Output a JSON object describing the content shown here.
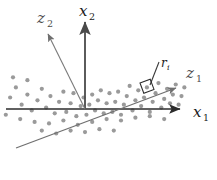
{
  "figure": {
    "title": "",
    "background_color": "#ffffff"
  },
  "chart_data": {
    "type": "scatter",
    "title": "",
    "xlabel": "",
    "ylabel": "",
    "grid": false,
    "legend": null,
    "xlim": [
      -1.0,
      1.0
    ],
    "ylim": [
      -1.0,
      1.0
    ],
    "point_color": "#9a9a9a",
    "point_radius": 2.1,
    "series": [
      {
        "name": "data-points",
        "points": [
          [
            -134,
            36
          ],
          [
            -118,
            24
          ],
          [
            -104,
            16
          ],
          [
            -96,
            30
          ],
          [
            -88,
            6
          ],
          [
            -80,
            20
          ],
          [
            -74,
            -2
          ],
          [
            -66,
            12
          ],
          [
            -60,
            28
          ],
          [
            -54,
            2
          ],
          [
            -48,
            18
          ],
          [
            -42,
            -6
          ],
          [
            -36,
            10
          ],
          [
            -30,
            24
          ],
          [
            -26,
            -4
          ],
          [
            -20,
            8
          ],
          [
            -16,
            22
          ],
          [
            -12,
            -10
          ],
          [
            -6,
            4
          ],
          [
            -2,
            16
          ],
          [
            2,
            -8
          ],
          [
            6,
            6
          ],
          [
            10,
            20
          ],
          [
            14,
            -2
          ],
          [
            18,
            12
          ],
          [
            22,
            26
          ],
          [
            26,
            -6
          ],
          [
            30,
            8
          ],
          [
            34,
            22
          ],
          [
            38,
            -4
          ],
          [
            42,
            10
          ],
          [
            46,
            24
          ],
          [
            50,
            -8
          ],
          [
            54,
            6
          ],
          [
            58,
            18
          ],
          [
            62,
            32
          ],
          [
            66,
            -2
          ],
          [
            70,
            12
          ],
          [
            74,
            26
          ],
          [
            78,
            4
          ],
          [
            82,
            16
          ],
          [
            86,
            30
          ],
          [
            90,
            -4
          ],
          [
            94,
            10
          ],
          [
            98,
            22
          ],
          [
            102,
            36
          ],
          [
            106,
            2
          ],
          [
            110,
            14
          ],
          [
            114,
            28
          ],
          [
            118,
            8
          ],
          [
            122,
            20
          ],
          [
            126,
            34
          ],
          [
            130,
            6
          ],
          [
            134,
            18
          ],
          [
            138,
            30
          ],
          [
            -110,
            -8
          ],
          [
            -90,
            -14
          ],
          [
            -70,
            -18
          ],
          [
            -50,
            -20
          ],
          [
            -30,
            -16
          ],
          [
            -10,
            -22
          ],
          [
            10,
            -18
          ],
          [
            30,
            -14
          ],
          [
            50,
            -16
          ],
          [
            70,
            -12
          ],
          [
            90,
            -10
          ],
          [
            110,
            -14
          ],
          [
            -60,
            -30
          ],
          [
            -40,
            -34
          ],
          [
            -20,
            -30
          ],
          [
            0,
            -32
          ],
          [
            20,
            -28
          ],
          [
            40,
            -30
          ],
          [
            -100,
            44
          ],
          [
            -80,
            40
          ]
        ]
      }
    ],
    "axes": [
      {
        "id": "x1",
        "label": "x",
        "subscript": "1",
        "style": "original",
        "color": "#2b2b2b",
        "stroke_width": 1.6,
        "arrow": true,
        "direction": "right",
        "angle_deg": 0
      },
      {
        "id": "x2",
        "label": "x",
        "subscript": "2",
        "style": "original",
        "color": "#4a4a4a",
        "stroke_width": 1.8,
        "arrow": true,
        "direction": "up",
        "angle_deg": 90
      },
      {
        "id": "z1",
        "label": "z",
        "subscript": "1",
        "style": "principal",
        "color": "#6a6a6a",
        "stroke_width": 1.2,
        "arrow": true,
        "direction": "upper-right",
        "angle_deg": 20
      },
      {
        "id": "z2",
        "label": "z",
        "subscript": "2",
        "style": "principal",
        "color": "#7a7a7a",
        "stroke_width": 1.1,
        "arrow": true,
        "direction": "upper-left",
        "angle_deg": 110
      }
    ],
    "annotations": [
      {
        "id": "residual",
        "label": "r",
        "subscript": "i",
        "kind": "residual-segment",
        "has_right_angle_marker": true,
        "color": "#1a1a1a"
      }
    ]
  },
  "labels": {
    "x1": {
      "main": "x",
      "sub": "1"
    },
    "x2": {
      "main": "x",
      "sub": "2"
    },
    "z1": {
      "main": "z",
      "sub": "1"
    },
    "z2": {
      "main": "z",
      "sub": "2"
    },
    "residual": {
      "main": "r",
      "sub": "i"
    }
  },
  "colors": {
    "point": "#9a9a9a",
    "axis_dark": "#2b2b2b",
    "axis_mid": "#4a4a4a",
    "axis_light": "#6f6f6f",
    "text": "#1a1a1a",
    "background": "#ffffff"
  }
}
